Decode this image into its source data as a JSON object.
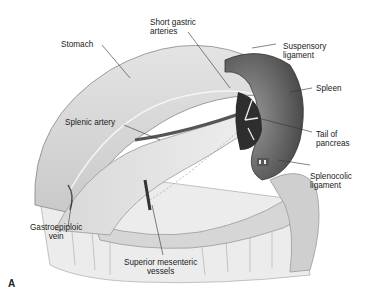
{
  "figure": {
    "panel_label": "A",
    "labels": {
      "stomach": "Stomach",
      "short_gastric_arteries": "Short gastric\narteries",
      "suspensory_ligament": "Suspensory\nligament",
      "spleen": "Spleen",
      "splenic_artery": "Splenic artery",
      "tail_of_pancreas": "Tail of\npancreas",
      "splenocolic_ligament": "Splenocolic\nligament",
      "gastroepiploic_vein": "Gastroepiploic\nvein",
      "superior_mesenteric_vessels": "Superior mesenteric\nvessels"
    }
  }
}
